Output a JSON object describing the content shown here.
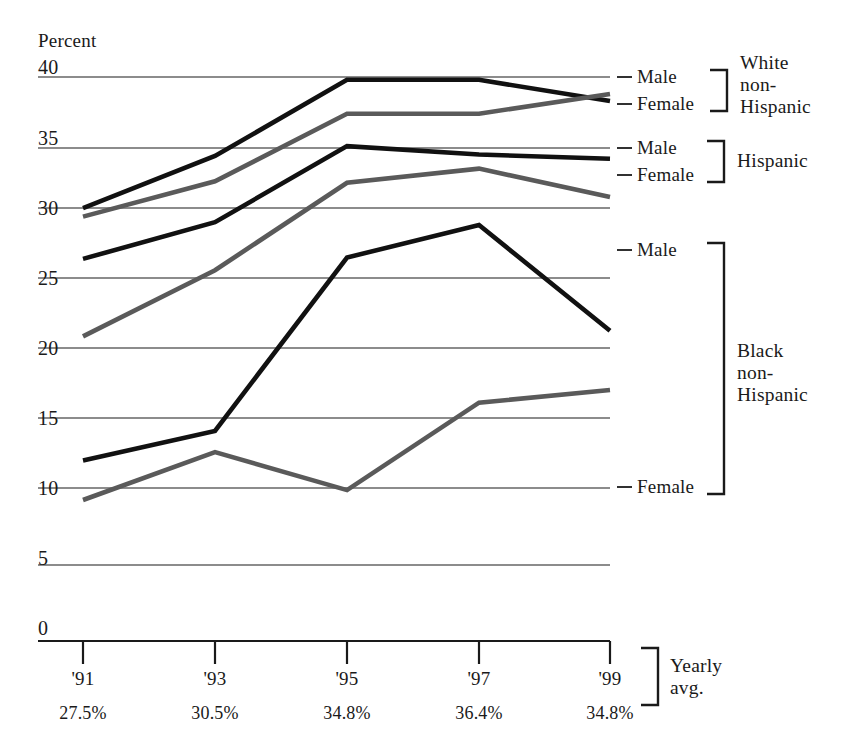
{
  "chart_data": {
    "type": "line",
    "title": "",
    "subtitle": "",
    "xlabel": "",
    "ylabel": "Percent",
    "ylim": [
      0,
      40
    ],
    "yticks": [
      0,
      5,
      10,
      15,
      20,
      25,
      30,
      35,
      40
    ],
    "ytick_labels": [
      "0",
      "5",
      "10",
      "15",
      "20",
      "25",
      "30",
      "35",
      "40"
    ],
    "grid": true,
    "legend_position": "right",
    "categories": [
      "'91",
      "'93",
      "'95",
      "'97",
      "'99"
    ],
    "x": [
      "'91",
      "'93",
      "'95",
      "'97",
      "'99"
    ],
    "series": [
      {
        "name": "White non-Hispanic Male",
        "group": "White non-Hispanic",
        "sex": "Male",
        "color": "#111111",
        "values": [
          30.7,
          34.4,
          39.8,
          39.8,
          38.3
        ]
      },
      {
        "name": "White non-Hispanic Female",
        "group": "White non-Hispanic",
        "sex": "Female",
        "color": "#5a5a5a",
        "values": [
          30.1,
          32.6,
          37.4,
          37.4,
          38.8
        ]
      },
      {
        "name": "Hispanic Male",
        "group": "Hispanic",
        "sex": "Male",
        "color": "#111111",
        "values": [
          27.1,
          29.7,
          35.1,
          34.5,
          34.2
        ]
      },
      {
        "name": "Hispanic Female",
        "group": "Hispanic",
        "sex": "Female",
        "color": "#5a5a5a",
        "values": [
          21.6,
          26.3,
          32.5,
          33.5,
          31.5
        ]
      },
      {
        "name": "Black non-Hispanic Male",
        "group": "Black non-Hispanic",
        "sex": "Male",
        "color": "#111111",
        "values": [
          12.8,
          14.9,
          27.2,
          29.5,
          22.0
        ]
      },
      {
        "name": "Black non-Hispanic Female",
        "group": "Black non-Hispanic",
        "sex": "Female",
        "color": "#5a5a5a",
        "values": [
          10.0,
          13.4,
          10.7,
          16.9,
          17.8
        ]
      }
    ],
    "yearly_avg_label": "Yearly\navg.",
    "yearly_avg": [
      "27.5%",
      "30.5%",
      "34.8%",
      "36.4%",
      "34.8%"
    ]
  },
  "axis": {
    "y_title": "Percent",
    "y_ticks": [
      "40",
      "35",
      "30",
      "25",
      "20",
      "15",
      "10",
      "5",
      "0"
    ],
    "x_ticks": [
      "'91",
      "'93",
      "'95",
      "'97",
      "'99"
    ]
  },
  "legend": {
    "groups": [
      {
        "name": "White non-Hispanic",
        "display": "White\nnon-\nHispanic",
        "entries": [
          {
            "label": "Male"
          },
          {
            "label": "Female"
          }
        ]
      },
      {
        "name": "Hispanic",
        "display": "Hispanic",
        "entries": [
          {
            "label": "Male"
          },
          {
            "label": "Female"
          }
        ]
      },
      {
        "name": "Black non-Hispanic",
        "display": "Black\nnon-\nHispanic",
        "entries": [
          {
            "label": "Male"
          },
          {
            "label": "Female"
          }
        ]
      }
    ]
  },
  "footer": {
    "yearly_avg_label": "Yearly\navg.",
    "yearly_avg_values": [
      "27.5%",
      "30.5%",
      "34.8%",
      "36.4%",
      "34.8%"
    ]
  }
}
